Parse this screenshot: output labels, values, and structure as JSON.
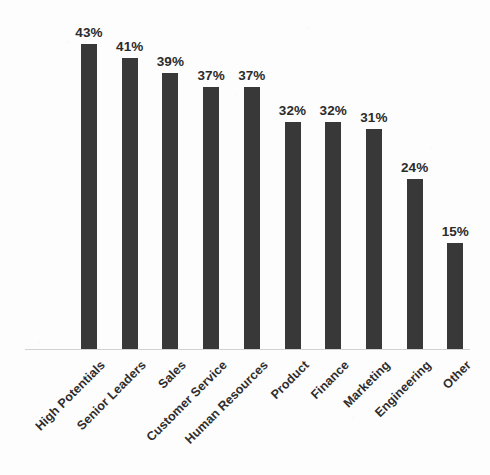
{
  "chart_data": {
    "type": "bar",
    "title": "",
    "subtitle": "",
    "xlabel": "",
    "ylabel": "",
    "ylim": [
      0,
      45
    ],
    "grid": false,
    "legend": false,
    "legend_position": "none",
    "orientation": "vertical",
    "value_suffix": "%",
    "bar_color": "#383838",
    "background_color": "#fdfdfd",
    "axis_line_color": "#d2d2d2",
    "label_rotation_degrees": -45,
    "categories": [
      "High Potentials",
      "Senior Leaders",
      "Sales",
      "Customer Service",
      "Human Resources",
      "Product",
      "Finance",
      "Marketing",
      "Engineering",
      "Other"
    ],
    "values": [
      43,
      41,
      39,
      37,
      37,
      32,
      32,
      31,
      24,
      15
    ],
    "value_labels": [
      "43%",
      "41%",
      "39%",
      "37%",
      "37%",
      "32%",
      "32%",
      "31%",
      "24%",
      "15%"
    ]
  }
}
